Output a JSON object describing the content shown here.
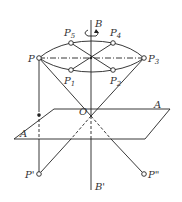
{
  "diagram": {
    "type": "geometric-projection",
    "colors": {
      "line": "#222222",
      "text": "#333333",
      "background": "#ffffff"
    },
    "axis": {
      "top_label": "B",
      "bottom_label": "B'",
      "rotation_icon": "rotation-arrow-icon"
    },
    "plane": {
      "label_right": "A",
      "label_left": "A"
    },
    "origin_label": "O",
    "points": {
      "P": {
        "label": "P",
        "sub": ""
      },
      "P1": {
        "label": "P",
        "sub": "1"
      },
      "P2": {
        "label": "P",
        "sub": "2"
      },
      "P3": {
        "label": "P",
        "sub": "3"
      },
      "P4": {
        "label": "P",
        "sub": "4"
      },
      "P5": {
        "label": "P",
        "sub": "5"
      },
      "Pprime": {
        "label": "P'"
      },
      "Pdouble": {
        "label": "P\""
      }
    }
  }
}
